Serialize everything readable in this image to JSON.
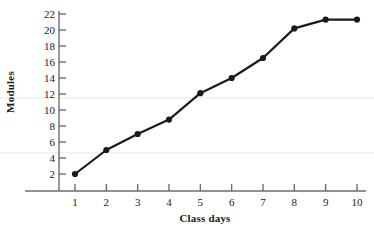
{
  "chart_data": {
    "type": "line",
    "title": "",
    "subtitle": "",
    "xlabel": "Class days",
    "ylabel": "Modules",
    "x": [
      1,
      2,
      3,
      4,
      5,
      6,
      7,
      8,
      9,
      10
    ],
    "values": [
      2.0,
      5.0,
      7.0,
      8.8,
      12.1,
      14.0,
      16.5,
      20.2,
      21.3,
      21.3
    ],
    "series": [
      {
        "name": "Modules completed",
        "values": [
          2.0,
          5.0,
          7.0,
          8.8,
          12.1,
          14.0,
          16.5,
          20.2,
          21.3,
          21.3
        ]
      }
    ],
    "xlim": [
      0.55,
      10.45
    ],
    "ylim": [
      0.0,
      23.0
    ],
    "xticks": [
      1,
      2,
      3,
      4,
      5,
      6,
      7,
      8,
      9,
      10
    ],
    "xticklabels": [
      "1",
      "2",
      "3",
      "4",
      "5",
      "6",
      "7",
      "8",
      "9",
      "10"
    ],
    "yticks": [
      2,
      4,
      6,
      8,
      10,
      12,
      14,
      16,
      18,
      20,
      22
    ],
    "yticklabels": [
      "2",
      "4",
      "6",
      "8",
      "10",
      "12",
      "14",
      "16",
      "18",
      "20",
      "22"
    ],
    "grid": false,
    "legend": false,
    "legend_position": "none",
    "marker": "filled-circle",
    "line_color": "#1a1a1a",
    "marker_color": "#1a1a1a",
    "axis_color": "#6e6e6e",
    "background_color": "#ffffff"
  },
  "axes": {
    "x_title": "Class days",
    "y_title": "Modules"
  }
}
